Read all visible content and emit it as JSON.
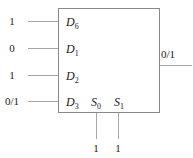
{
  "diagram": {
    "component": {
      "name": "multiplexer-box",
      "shape": "rectangle"
    },
    "data_inputs": [
      {
        "port": "D",
        "subscript": "6",
        "value": "1"
      },
      {
        "port": "D",
        "subscript": "1",
        "value": "0"
      },
      {
        "port": "D",
        "subscript": "2",
        "value": "1"
      },
      {
        "port": "D",
        "subscript": "3",
        "value": "0/1"
      }
    ],
    "select_inputs": [
      {
        "port": "S",
        "subscript": "0",
        "value": "1"
      },
      {
        "port": "S",
        "subscript": "1",
        "value": "1"
      }
    ],
    "output": {
      "value": "0/1"
    },
    "colors": {
      "box_stroke": "#8a8a8a",
      "wire": "#a6a6a6",
      "text": "#1a1a1a",
      "background": "#ffffff"
    }
  }
}
